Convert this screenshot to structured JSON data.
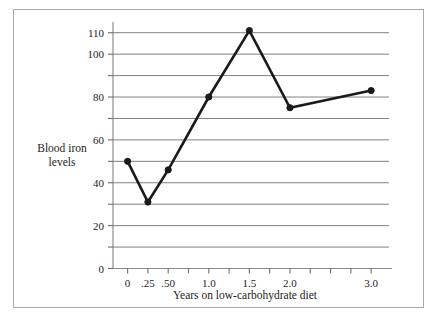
{
  "figure": {
    "background_color": "#ffffff",
    "frame_color": "#a9a9a9"
  },
  "chart_data": {
    "type": "line",
    "title": "",
    "subtitle": "",
    "xlabel": "Years on low-carbohydrate diet",
    "ylabel": "Blood iron levels",
    "ylabel_line1": "Blood iron",
    "ylabel_line2": "levels",
    "x": [
      0,
      0.25,
      0.5,
      1.0,
      1.5,
      2.0,
      3.0
    ],
    "values": [
      50,
      31,
      46,
      80,
      111,
      75,
      83
    ],
    "series": [
      {
        "name": "Blood iron levels",
        "x": [
          0,
          0.25,
          0.5,
          1.0,
          1.5,
          2.0,
          3.0
        ],
        "values": [
          50,
          31,
          46,
          80,
          111,
          75,
          83
        ]
      }
    ],
    "points": [
      {
        "x": 0,
        "y": 50,
        "x_label": "0"
      },
      {
        "x": 0.25,
        "y": 31,
        "x_label": ".25"
      },
      {
        "x": 0.5,
        "y": 46,
        "x_label": ".50"
      },
      {
        "x": 1.0,
        "y": 80,
        "x_label": "1.0"
      },
      {
        "x": 1.5,
        "y": 111,
        "x_label": "1.5"
      },
      {
        "x": 2.0,
        "y": 75,
        "x_label": "2.0"
      },
      {
        "x": 3.0,
        "y": 83,
        "x_label": "3.0"
      }
    ],
    "x_tick_positions": [
      0,
      0.25,
      0.5,
      0.75,
      1.0,
      1.25,
      1.5,
      1.75,
      2.0,
      2.25,
      2.5,
      2.75,
      3.0
    ],
    "x_tick_labels": [
      {
        "x": 0,
        "label": "0"
      },
      {
        "x": 0.25,
        "label": ".25"
      },
      {
        "x": 0.5,
        "label": ".50"
      },
      {
        "x": 1.0,
        "label": "1.0"
      },
      {
        "x": 1.5,
        "label": "1.5"
      },
      {
        "x": 2.0,
        "label": "2.0"
      },
      {
        "x": 3.0,
        "label": "3.0"
      }
    ],
    "y_tick_positions": [
      0,
      10,
      20,
      30,
      40,
      50,
      60,
      70,
      80,
      90,
      100,
      110
    ],
    "y_tick_labels": [
      {
        "y": 0,
        "label": "0"
      },
      {
        "y": 20,
        "label": "20"
      },
      {
        "y": 40,
        "label": "40"
      },
      {
        "y": 60,
        "label": "60"
      },
      {
        "y": 80,
        "label": "80"
      },
      {
        "y": 100,
        "label": "100"
      },
      {
        "y": 110,
        "label": "110"
      }
    ],
    "xlim": [
      -0.18,
      3.22
    ],
    "ylim": [
      0,
      115
    ],
    "grid": true,
    "grid_axis": "y",
    "grid_color": "#808080",
    "line_color": "#1a1a1a",
    "marker": "circle",
    "marker_color": "#1a1a1a",
    "legend": false,
    "legend_position": "none"
  }
}
